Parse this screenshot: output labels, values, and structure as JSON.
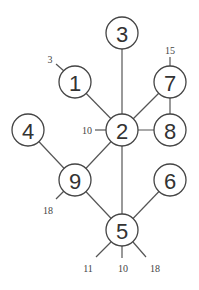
{
  "diagram": {
    "type": "graph",
    "nodes": [
      {
        "id": "3",
        "label": "3",
        "x": 122,
        "y": 33
      },
      {
        "id": "1",
        "label": "1",
        "x": 75,
        "y": 82
      },
      {
        "id": "7",
        "label": "7",
        "x": 170,
        "y": 82
      },
      {
        "id": "4",
        "label": "4",
        "x": 28,
        "y": 130
      },
      {
        "id": "2",
        "label": "2",
        "x": 122,
        "y": 130
      },
      {
        "id": "8",
        "label": "8",
        "x": 170,
        "y": 130
      },
      {
        "id": "9",
        "label": "9",
        "x": 75,
        "y": 180
      },
      {
        "id": "6",
        "label": "6",
        "x": 170,
        "y": 180
      },
      {
        "id": "5",
        "label": "5",
        "x": 122,
        "y": 230
      }
    ],
    "edges": [
      {
        "from": "3",
        "to": "2"
      },
      {
        "from": "1",
        "to": "2"
      },
      {
        "from": "7",
        "to": "2"
      },
      {
        "from": "7",
        "to": "8"
      },
      {
        "from": "2",
        "to": "8"
      },
      {
        "from": "2",
        "to": "9"
      },
      {
        "from": "2",
        "to": "5"
      },
      {
        "from": "4",
        "to": "9"
      },
      {
        "from": "9",
        "to": "5"
      },
      {
        "from": "6",
        "to": "5"
      }
    ],
    "stubs": [
      {
        "node": "1",
        "label": "3",
        "x1": 64,
        "y1": 71,
        "x2": 56,
        "y2": 64,
        "lx": 50,
        "ly": 59
      },
      {
        "node": "7",
        "label": "15",
        "x1": 170,
        "y1": 66,
        "x2": 170,
        "y2": 57,
        "lx": 170,
        "ly": 50
      },
      {
        "node": "2",
        "label": "10",
        "x1": 106,
        "y1": 130,
        "x2": 95,
        "y2": 130,
        "lx": 87,
        "ly": 130
      },
      {
        "node": "9",
        "label": "18",
        "x1": 64,
        "y1": 191,
        "x2": 56,
        "y2": 199,
        "lx": 48,
        "ly": 210
      },
      {
        "node": "5",
        "label": "11",
        "x1": 111,
        "y1": 242,
        "x2": 96,
        "y2": 257,
        "lx": 88,
        "ly": 268
      },
      {
        "node": "5",
        "label": "10",
        "x1": 122,
        "y1": 246,
        "x2": 122,
        "y2": 258,
        "lx": 123,
        "ly": 268
      },
      {
        "node": "5",
        "label": "18",
        "x1": 133,
        "y1": 242,
        "x2": 146,
        "y2": 257,
        "lx": 155,
        "ly": 268
      }
    ],
    "node_radius": 16
  }
}
